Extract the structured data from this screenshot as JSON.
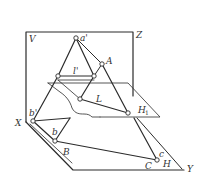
{
  "diagram": {
    "title": "",
    "labels": {
      "V": "V",
      "Z": "Z",
      "a_prime": "a'",
      "l_prime": "l'",
      "A": "A",
      "L": "L",
      "H1": "H",
      "H1_sub": "1",
      "X": "X",
      "b_prime": "b'",
      "b": "b",
      "B": "B",
      "C": "C",
      "c": "c",
      "H": "H",
      "Y": "Y"
    },
    "colors": {
      "line": "#2b2b2b",
      "background": "#ffffff",
      "text": "#333333"
    }
  }
}
